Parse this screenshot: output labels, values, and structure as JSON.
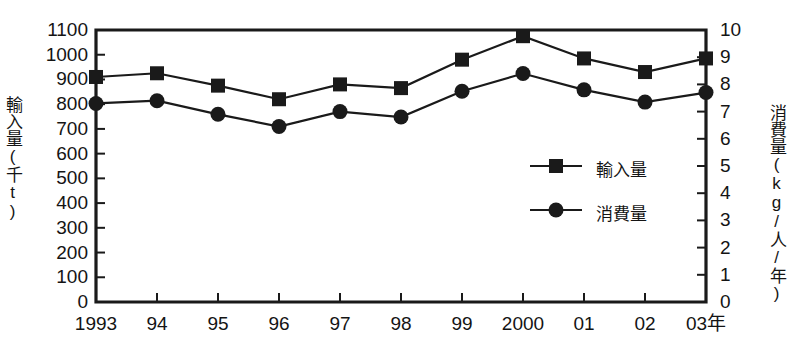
{
  "chart_data": {
    "type": "line",
    "title": "",
    "subtitle": "",
    "xlabel": "",
    "ylabel": "輸入量(千t)",
    "y2label": "消費量(kg/人/年)",
    "categories": [
      "1993",
      "94",
      "95",
      "96",
      "97",
      "98",
      "99",
      "2000",
      "01",
      "02",
      "03年"
    ],
    "ylim": [
      0,
      1100
    ],
    "y2lim": [
      0,
      10
    ],
    "yticks": [
      "1100",
      "1000",
      "900",
      "800",
      "700",
      "600",
      "500",
      "400",
      "300",
      "200",
      "100",
      "0"
    ],
    "ytick_values": [
      1100,
      1000,
      900,
      800,
      700,
      600,
      500,
      400,
      300,
      200,
      100,
      0
    ],
    "y2ticks": [
      "10",
      "9",
      "8",
      "7",
      "6",
      "5",
      "4",
      "3",
      "2",
      "1",
      "0"
    ],
    "y2tick_values": [
      10,
      9,
      8,
      7,
      6,
      5,
      4,
      3,
      2,
      1,
      0
    ],
    "grid": false,
    "legend_position": "center-right",
    "series": [
      {
        "name": "輸入量",
        "marker": "square",
        "axis": "left",
        "color": "#1a1a1a",
        "values": [
          910,
          925,
          875,
          820,
          880,
          865,
          980,
          1075,
          985,
          930,
          985
        ]
      },
      {
        "name": "消費量",
        "marker": "circle",
        "axis": "right",
        "color": "#1a1a1a",
        "values": [
          7.3,
          7.4,
          6.9,
          6.45,
          7.0,
          6.8,
          7.75,
          8.4,
          7.8,
          7.35,
          7.7
        ]
      }
    ]
  },
  "legend": {
    "items": [
      {
        "label": "輸入量",
        "marker": "square"
      },
      {
        "label": "消費量",
        "marker": "circle"
      }
    ]
  }
}
